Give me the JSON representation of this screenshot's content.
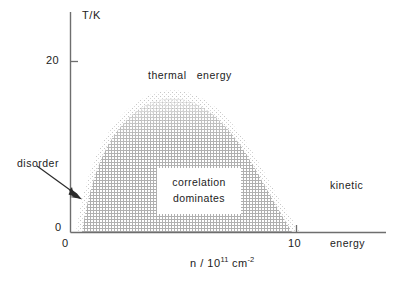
{
  "chart_data": {
    "type": "area",
    "title": "",
    "subtitle": "",
    "xlabel_html": "n / 10<sup>11</sup> cm<sup>-2</sup>",
    "xlabel": "n / 10^11 cm^-2",
    "ylabel": "T/K",
    "xlim": [
      0,
      13.2
    ],
    "ylim": [
      0,
      30
    ],
    "grid": false,
    "legend_position": "none",
    "x_ticks": [
      {
        "value": 0,
        "label": "0"
      },
      {
        "value": 10,
        "label": "10"
      }
    ],
    "y_ticks": [
      {
        "value": 0,
        "label": "0"
      },
      {
        "value": 20,
        "label": "20"
      }
    ],
    "series": [
      {
        "name": "correlation dominates boundary",
        "style": "stippled-dome",
        "fill_color": "#b9b9b9",
        "x": [
          0.45,
          0.9,
          1.5,
          2.2,
          3.0,
          3.9,
          4.8,
          5.6,
          6.4,
          7.2,
          8.0,
          8.8,
          9.5,
          10.2,
          10.9,
          11.5,
          11.9
        ],
        "y": [
          0.0,
          2.6,
          6.4,
          10.4,
          13.6,
          16.1,
          17.5,
          18.0,
          17.7,
          16.7,
          15.1,
          13.0,
          10.6,
          7.9,
          5.0,
          2.2,
          0.0
        ]
      }
    ],
    "annotations": [
      {
        "name": "thermal-energy",
        "text": "thermal   energy",
        "x": 5.1,
        "y": 24.2
      },
      {
        "name": "kinetic-energy",
        "line1": "kinetic",
        "line2": "energy",
        "x": 11.9,
        "y": 16.0
      },
      {
        "name": "disorder",
        "text": "disorder",
        "x": 0.0,
        "y": 13.6
      },
      {
        "name": "correlation-dominates",
        "line1": "correlation",
        "line2": "dominates",
        "x": 5.8,
        "y": 9.0
      }
    ],
    "arrow": {
      "name": "disorder-arrow",
      "from_px": [
        37,
        167
      ],
      "to_px": [
        81,
        199
      ],
      "color": "#2b2b2b"
    },
    "colors": {
      "axis": "#6e6e6e",
      "text": "#222222",
      "stipple": "#b5b5b5",
      "background": "#ffffff"
    }
  },
  "labels": {
    "y_axis_title": "T/K",
    "y_tick_20": "20",
    "y_tick_0": "0",
    "x_tick_0": "0",
    "x_tick_10": "10",
    "thermal_energy": "thermal   energy",
    "kinetic_energy_line1": "kinetic",
    "kinetic_energy_line2": "energy",
    "disorder": "disorder",
    "correlation_line1": "correlation",
    "correlation_line2": "dominates"
  }
}
